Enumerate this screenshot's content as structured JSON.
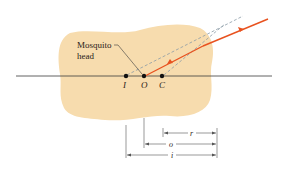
{
  "diagram": {
    "annotation": {
      "line1": "Mosquito",
      "line2": "head"
    },
    "points": [
      {
        "id": "I",
        "label": "I",
        "x": 125
      },
      {
        "id": "O",
        "label": "O",
        "x": 144
      },
      {
        "id": "C",
        "label": "C",
        "x": 162
      }
    ],
    "dimensions": [
      {
        "id": "r",
        "label": "r",
        "from": "C",
        "to": "surface"
      },
      {
        "id": "o",
        "label": "o",
        "from": "O",
        "to": "surface"
      },
      {
        "id": "i",
        "label": "i",
        "from": "I",
        "to": "surface"
      }
    ],
    "colors": {
      "amber": "#f7dcae",
      "ray": "#e8521f",
      "axis": "#3a3a3a",
      "dashed": "#8a9aa6",
      "text": "#2a2218"
    }
  }
}
